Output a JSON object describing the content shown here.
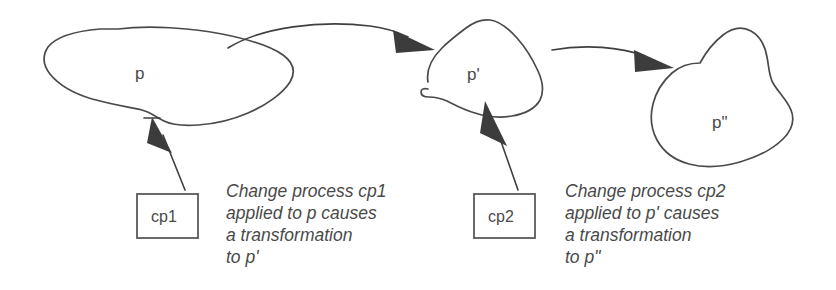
{
  "diagram": {
    "stroke_color": "#4a4a4a",
    "text_color": "#4a4a4a",
    "background_color": "#ffffff",
    "shapes": [
      {
        "id": "blob-p",
        "label": "p",
        "kind": "blob"
      },
      {
        "id": "blob-p-prime",
        "label": "p'",
        "kind": "blob"
      },
      {
        "id": "blob-p-double-prime",
        "label": "p\"",
        "kind": "blob"
      }
    ],
    "boxes": [
      {
        "id": "box-cp1",
        "label": "cp1"
      },
      {
        "id": "box-cp2",
        "label": "cp2"
      }
    ],
    "captions": [
      {
        "id": "caption-cp1",
        "lines": [
          "Change process cp1",
          "applied to p causes",
          "a transformation",
          "to p'"
        ]
      },
      {
        "id": "caption-cp2",
        "lines": [
          "Change process cp2",
          "applied to p' causes",
          "a transformation",
          "to p\""
        ]
      }
    ],
    "connectors": [
      {
        "id": "arrow-p-to-p-prime",
        "from": "blob-p",
        "to": "blob-p-prime",
        "style": "curved"
      },
      {
        "id": "arrow-p-prime-to-p-double-prime",
        "from": "blob-p-prime",
        "to": "blob-p-double-prime",
        "style": "curved"
      },
      {
        "id": "arrow-cp1-to-p",
        "from": "box-cp1",
        "to": "blob-p",
        "style": "straight"
      },
      {
        "id": "arrow-cp2-to-p-prime",
        "from": "box-cp2",
        "to": "blob-p-prime",
        "style": "straight"
      }
    ]
  }
}
